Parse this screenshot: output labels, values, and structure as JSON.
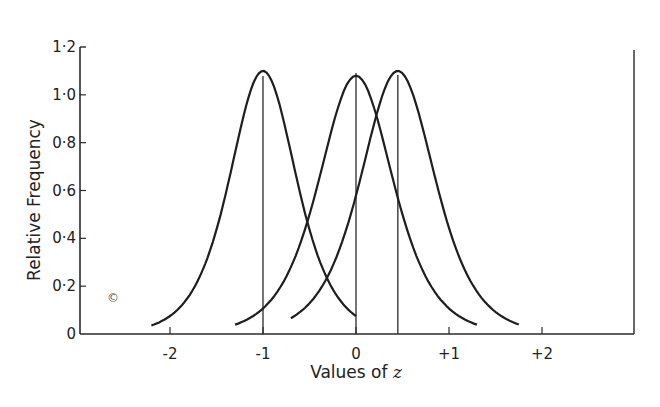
{
  "chart_data": {
    "type": "line",
    "title": "",
    "xlabel": "Values of z",
    "ylabel": "Relative Frequency",
    "xlim": [
      -3.1,
      3.1
    ],
    "ylim": [
      0,
      1.2
    ],
    "grid": false,
    "legend": null,
    "x_ticks": [
      "-2",
      "-1",
      "0",
      "+1",
      "+2"
    ],
    "y_ticks": [
      "0",
      "0·2",
      "0·4",
      "0·6",
      "0·8",
      "1·0",
      "1·2"
    ],
    "series": [
      {
        "name": "curve-1",
        "mean": -1.0,
        "peak": 1.1,
        "x_range": [
          -2.2,
          0.0
        ],
        "x": [
          -2.2,
          -1.8,
          -1.5,
          -1.2,
          -1.0,
          -0.8,
          -0.5,
          -0.2,
          0.0
        ],
        "y": [
          0.0,
          0.28,
          0.62,
          0.98,
          1.1,
          0.98,
          0.55,
          0.15,
          0.0
        ]
      },
      {
        "name": "curve-2",
        "mean": 0.0,
        "peak": 1.08,
        "x_range": [
          -1.3,
          1.3
        ],
        "x": [
          -1.3,
          -1.0,
          -0.6,
          -0.3,
          0.0,
          0.3,
          0.6,
          1.0,
          1.3
        ],
        "y": [
          0.0,
          0.08,
          0.5,
          0.93,
          1.08,
          0.93,
          0.5,
          0.08,
          0.0
        ]
      },
      {
        "name": "curve-3",
        "mean": 0.45,
        "peak": 1.1,
        "x_range": [
          -0.7,
          1.8
        ],
        "x": [
          -0.7,
          -0.4,
          0.0,
          0.25,
          0.45,
          0.65,
          0.9,
          1.3,
          1.8
        ],
        "y": [
          0.0,
          0.1,
          0.55,
          0.95,
          1.1,
          0.95,
          0.55,
          0.1,
          0.0
        ]
      }
    ],
    "vertical_lines": [
      -1.0,
      0.0,
      0.45
    ],
    "annotation": "©"
  },
  "labels": {
    "xlabel_prefix": "Values of ",
    "xlabel_var": "z",
    "ylabel": "Relative  Frequency",
    "mark": "©"
  }
}
